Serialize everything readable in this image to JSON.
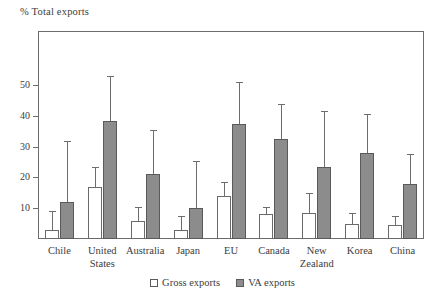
{
  "chart_data": {
    "type": "bar",
    "title": "",
    "subtitle": "",
    "ylabel": "% Total exports",
    "xlabel": "",
    "ylim": [
      0,
      57
    ],
    "yticks": [
      10,
      20,
      30,
      40,
      50
    ],
    "grid": false,
    "legend_position": "bottom-center",
    "categories": [
      "Chile",
      "United States",
      "Australia",
      "Japan",
      "EU",
      "Canada",
      "New Zealand",
      "Korea",
      "China"
    ],
    "category_lines": [
      [
        "Chile"
      ],
      [
        "United",
        "States"
      ],
      [
        "Australia"
      ],
      [
        "Japan"
      ],
      [
        "EU"
      ],
      [
        "Canada"
      ],
      [
        "New",
        "Zealand"
      ],
      [
        "Korea"
      ],
      [
        "China"
      ]
    ],
    "series": [
      {
        "name": "Gross exports",
        "color": "#ffffff",
        "edge_color": "#6a6a6a",
        "values": [
          3.0,
          17.0,
          6.0,
          3.0,
          14.0,
          8.0,
          8.5,
          5.0,
          4.5
        ],
        "error_high": [
          9.0,
          23.5,
          10.5,
          7.5,
          18.5,
          10.5,
          15.0,
          8.5,
          7.5
        ]
      },
      {
        "name": "VA exports",
        "color": "#8c8c8c",
        "edge_color": "#5a5a5a",
        "values": [
          12.0,
          38.5,
          21.0,
          10.0,
          37.5,
          32.5,
          23.5,
          28.0,
          18.0
        ],
        "error_high": [
          32.0,
          53.0,
          35.5,
          25.5,
          51.0,
          44.0,
          41.5,
          40.5,
          27.5
        ]
      }
    ]
  },
  "legend": {
    "entries": [
      {
        "label": "Gross exports",
        "style": "gross"
      },
      {
        "label": "VA exports",
        "style": "va"
      }
    ]
  }
}
